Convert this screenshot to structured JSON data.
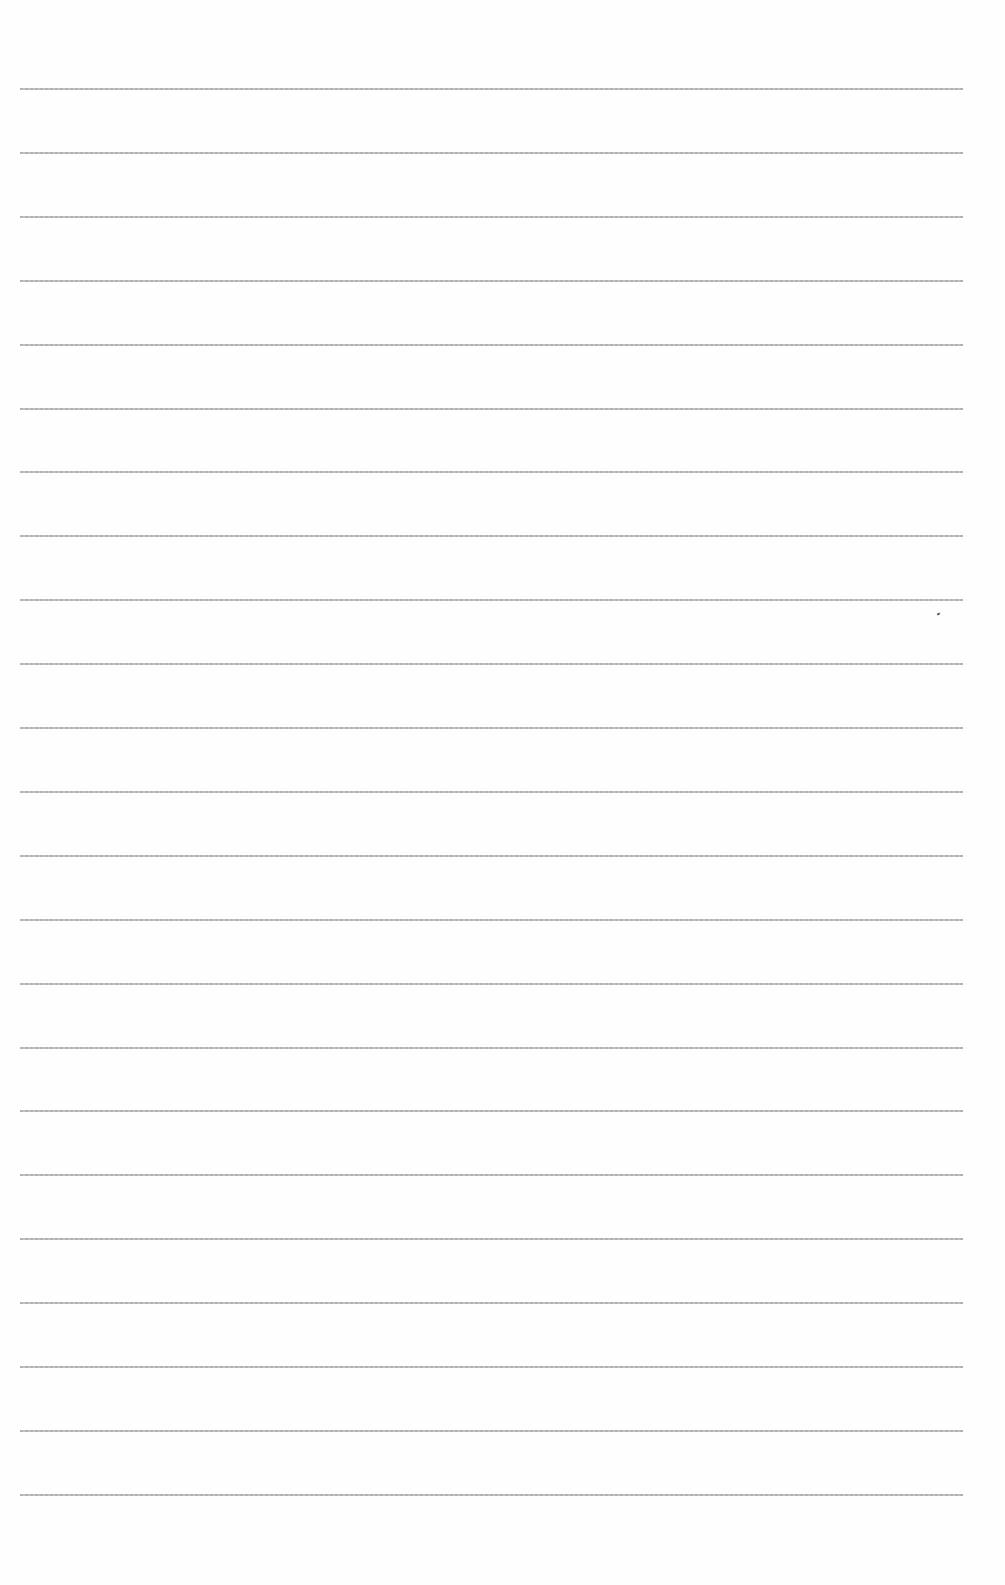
{
  "page": {
    "type": "blank ruled sheet",
    "line_count": 23,
    "first_line_y": 88,
    "line_spacing": 63.9,
    "line_color": "#a9a9a9",
    "background": "#ffffff"
  }
}
